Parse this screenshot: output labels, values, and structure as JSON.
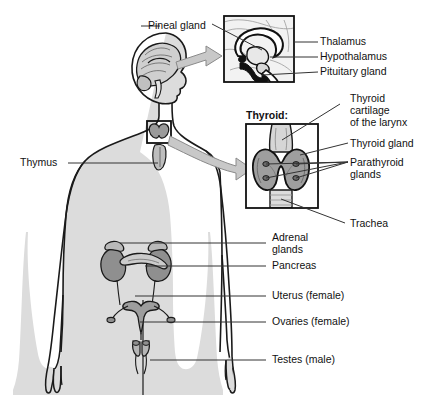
{
  "figure": {
    "background_color": "#ffffff",
    "body_fill": "#dcdcdc",
    "organ_fill_dark": "#8f8f8f",
    "organ_fill_mid": "#b4b4b4",
    "organ_fill_light": "#d2d2d2",
    "outline_color": "#1a1a1a",
    "leader_color": "#333333",
    "arrow_fill": "#c8c8c8"
  },
  "insets": {
    "brain": {
      "caption": "",
      "box": "midsagittal brain section"
    },
    "thyroid": {
      "caption": "Thyroid:"
    }
  },
  "labels": {
    "pineal_gland": "Pineal gland",
    "thalamus": "Thalamus",
    "hypothalamus": "Hypothalamus",
    "pituitary_gland": "Pituitary gland",
    "thyroid_caption": "Thyroid:",
    "thyroid_cartilage_l1": "Thyroid",
    "thyroid_cartilage_l2": "cartilage",
    "thyroid_cartilage_l3": "of the larynx",
    "thyroid_gland": "Thyroid gland",
    "parathyroid_l1": "Parathyroid",
    "parathyroid_l2": "glands",
    "trachea": "Trachea",
    "thymus": "Thymus",
    "adrenal_l1": "Adrenal",
    "adrenal_l2": "glands",
    "pancreas": "Pancreas",
    "uterus": "Uterus (female)",
    "ovaries": "Ovaries (female)",
    "testes": "Testes (male)"
  },
  "icons": {
    "arrow_brain": "block-arrow-icon",
    "arrow_thyroid": "curved-block-arrow-icon"
  }
}
